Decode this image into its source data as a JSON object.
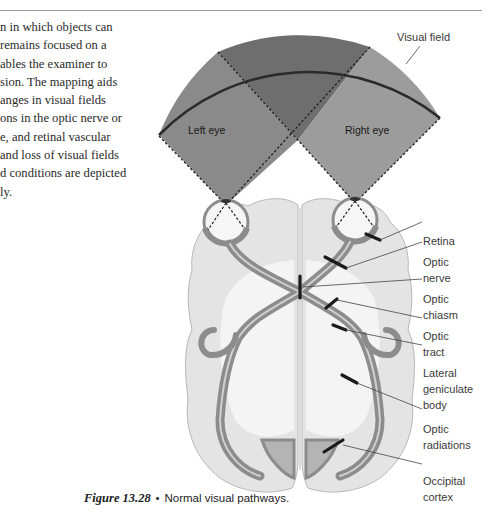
{
  "page": {
    "body_text_lines": [
      "n in which objects can",
      " remains focused on a",
      "ables the examiner to",
      "sion. The mapping aids",
      "anges in visual fields",
      "ons in the optic nerve or",
      "e, and retinal vascular",
      " and loss of visual fields",
      "d conditions are depicted",
      "ly."
    ]
  },
  "figure": {
    "number": "Figure 13.28",
    "bullet": "•",
    "caption": "Normal visual pathways.",
    "visual_field_label": "Visual field",
    "left_eye_label": "Left eye",
    "right_eye_label": "Right eye",
    "labels": [
      {
        "id": "retina",
        "lines": [
          "Retina"
        ]
      },
      {
        "id": "optic-nerve",
        "lines": [
          "Optic",
          "nerve"
        ]
      },
      {
        "id": "optic-chiasm",
        "lines": [
          "Optic",
          "chiasm"
        ]
      },
      {
        "id": "optic-tract",
        "lines": [
          "Optic",
          "tract"
        ]
      },
      {
        "id": "lateral-geniculate-body",
        "lines": [
          "Lateral",
          "geniculate",
          "body"
        ]
      },
      {
        "id": "optic-radiations",
        "lines": [
          "Optic",
          "radiations"
        ]
      },
      {
        "id": "occipital-cortex",
        "lines": [
          "Occipital",
          "cortex"
        ]
      }
    ],
    "colors": {
      "overlap_field": "#6e6e6e",
      "left_field": "#8a8a8a",
      "right_field": "#9c9c9c",
      "brain_fill": "#e6e6e6",
      "pathway": "#8c8c8c",
      "arc": "#2b2b2b"
    }
  }
}
